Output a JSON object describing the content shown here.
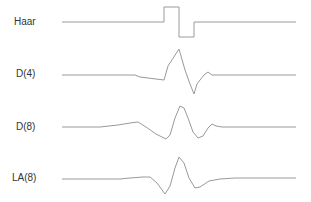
{
  "chart_data": {
    "type": "line",
    "title": "",
    "xlabel": "",
    "ylabel": "",
    "grid": false,
    "legend": "row labels at left",
    "series": [
      {
        "name": "Haar",
        "label_pos": [
          14,
          16
        ],
        "points": [
          [
            62,
            22
          ],
          [
            164,
            22
          ],
          [
            164,
            7
          ],
          [
            179,
            7
          ],
          [
            179,
            37
          ],
          [
            194,
            37
          ],
          [
            194,
            22
          ],
          [
            296,
            22
          ]
        ]
      },
      {
        "name": "D(4)",
        "label_pos": [
          16,
          68
        ],
        "points": [
          [
            62,
            75
          ],
          [
            135,
            75
          ],
          [
            140,
            77
          ],
          [
            164,
            80
          ],
          [
            168,
            66
          ],
          [
            179,
            49
          ],
          [
            185,
            70
          ],
          [
            190,
            84
          ],
          [
            194,
            94
          ],
          [
            197,
            84
          ],
          [
            200,
            80
          ],
          [
            204,
            75
          ],
          [
            208,
            72
          ],
          [
            212,
            75
          ],
          [
            215,
            75
          ],
          [
            296,
            75
          ]
        ]
      },
      {
        "name": "D(8)",
        "label_pos": [
          16,
          121
        ],
        "points": [
          [
            62,
            127
          ],
          [
            100,
            127
          ],
          [
            118,
            125
          ],
          [
            130,
            123
          ],
          [
            138,
            122
          ],
          [
            146,
            127
          ],
          [
            156,
            134
          ],
          [
            166,
            139
          ],
          [
            170,
            135
          ],
          [
            175,
            118
          ],
          [
            180,
            106
          ],
          [
            184,
            108
          ],
          [
            188,
            118
          ],
          [
            193,
            132
          ],
          [
            198,
            138
          ],
          [
            203,
            136
          ],
          [
            208,
            128
          ],
          [
            212,
            124
          ],
          [
            216,
            126
          ],
          [
            222,
            127
          ],
          [
            296,
            127
          ]
        ]
      },
      {
        "name": "LA(8)",
        "label_pos": [
          12,
          172
        ],
        "points": [
          [
            62,
            179
          ],
          [
            120,
            179
          ],
          [
            130,
            178
          ],
          [
            143,
            177
          ],
          [
            150,
            177
          ],
          [
            157,
            183
          ],
          [
            165,
            194
          ],
          [
            170,
            186
          ],
          [
            175,
            168
          ],
          [
            179,
            157
          ],
          [
            184,
            163
          ],
          [
            189,
            178
          ],
          [
            195,
            188
          ],
          [
            200,
            187
          ],
          [
            209,
            181
          ],
          [
            220,
            179
          ],
          [
            235,
            178
          ],
          [
            296,
            178
          ]
        ]
      }
    ],
    "xlim": [
      0,
      311
    ],
    "ylim": [
      0,
      202
    ]
  },
  "colors": {
    "line": "#9a9a9a",
    "label": "#333333",
    "background": "#ffffff"
  }
}
